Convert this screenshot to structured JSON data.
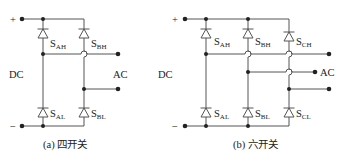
{
  "figure": {
    "panels": [
      {
        "id": "a",
        "caption": "(a) 四开关",
        "dc_label": "DC",
        "ac_label": "AC",
        "plus": "+",
        "minus": "−",
        "switches": [
          {
            "main": "S",
            "sub": "AH"
          },
          {
            "main": "S",
            "sub": "BH"
          },
          {
            "main": "S",
            "sub": "AL"
          },
          {
            "main": "S",
            "sub": "BL"
          }
        ]
      },
      {
        "id": "b",
        "caption": "(b) 六开关",
        "dc_label": "DC",
        "ac_label": "AC",
        "plus": "+",
        "minus": "−",
        "switches": [
          {
            "main": "S",
            "sub": "AH"
          },
          {
            "main": "S",
            "sub": "BH"
          },
          {
            "main": "S",
            "sub": "CH"
          },
          {
            "main": "S",
            "sub": "AL"
          },
          {
            "main": "S",
            "sub": "BL"
          },
          {
            "main": "S",
            "sub": "CL"
          }
        ]
      }
    ]
  }
}
